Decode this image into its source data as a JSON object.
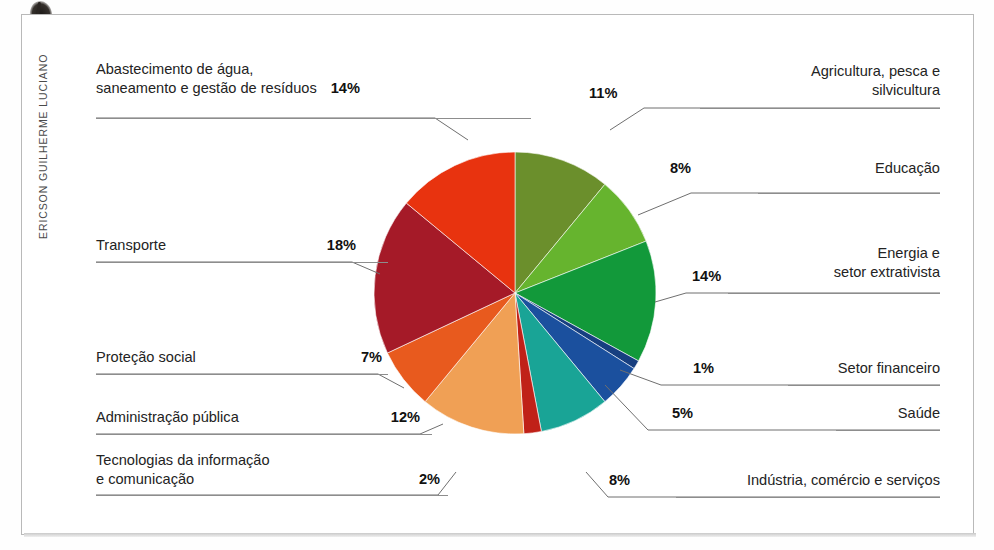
{
  "credit": "ERICSON GUILHERME LUCIANO",
  "chart_data": {
    "type": "pie",
    "title": "",
    "subtitle": "",
    "xlabel": "",
    "ylabel": "",
    "legend_position": "callout-labels",
    "grid": false,
    "unit": "%",
    "total": 100,
    "start_angle_deg": 0,
    "direction": "clockwise",
    "categories": [
      "Agricultura, pesca e silvicultura",
      "Educação",
      "Energia e setor extrativista",
      "Setor financeiro",
      "Saúde",
      "Indústria, comércio e serviços",
      "Tecnologias da informação e comunicação",
      "Administração pública",
      "Proteção social",
      "Transporte",
      "Abastecimento de água, saneamento e gestão de resíduos"
    ],
    "values": [
      11,
      8,
      14,
      1,
      5,
      8,
      2,
      12,
      7,
      18,
      14
    ],
    "colors": [
      "#6b8f2c",
      "#66b42e",
      "#12993a",
      "#173f80",
      "#1b509e",
      "#19a496",
      "#c02118",
      "#f0a055",
      "#e85a1e",
      "#a51a28",
      "#e8330f"
    ],
    "slices": [
      {
        "label": "Agricultura, pesca e silvicultura",
        "value": 11,
        "pct": "11%",
        "color": "#6b8f2c"
      },
      {
        "label": "Educação",
        "value": 8,
        "pct": "8%",
        "color": "#66b42e"
      },
      {
        "label": "Energia e setor extrativista",
        "value": 14,
        "pct": "14%",
        "color": "#12993a"
      },
      {
        "label": "Setor financeiro",
        "value": 1,
        "pct": "1%",
        "color": "#173f80"
      },
      {
        "label": "Saúde",
        "value": 5,
        "pct": "5%",
        "color": "#1b509e"
      },
      {
        "label": "Indústria, comércio e serviços",
        "value": 8,
        "pct": "8%",
        "color": "#19a496"
      },
      {
        "label": "Tecnologias da informação e comunicação",
        "value": 2,
        "pct": "2%",
        "color": "#c02118"
      },
      {
        "label": "Administração pública",
        "value": 12,
        "pct": "12%",
        "color": "#f0a055"
      },
      {
        "label": "Proteção social",
        "value": 7,
        "pct": "7%",
        "color": "#e85a1e"
      },
      {
        "label": "Transporte",
        "value": 18,
        "pct": "18%",
        "color": "#a51a28"
      },
      {
        "label": "Abastecimento de água, saneamento e gestão de resíduos",
        "value": 14,
        "pct": "14%",
        "color": "#e8330f"
      }
    ]
  },
  "labels": {
    "abastecimento": {
      "text": "Abastecimento de água,\nsaneamento e gestão de resíduos",
      "pct": "14%"
    },
    "transporte": {
      "text": "Transporte",
      "pct": "18%"
    },
    "protecao": {
      "text": "Proteção social",
      "pct": "7%"
    },
    "administracao": {
      "text": "Administração pública",
      "pct": "12%"
    },
    "tecnologias": {
      "text": "Tecnologias da informação\ne comunicação",
      "pct": "2%"
    },
    "agricultura": {
      "text": "Agricultura, pesca e\nsilvicultura",
      "pct": "11%"
    },
    "educacao": {
      "text": "Educação",
      "pct": "8%"
    },
    "energia": {
      "text": "Energia e\nsetor extrativista",
      "pct": "14%"
    },
    "financeiro": {
      "text": "Setor financeiro",
      "pct": "1%"
    },
    "saude": {
      "text": "Saúde",
      "pct": "5%"
    },
    "industria": {
      "text": "Indústria, comércio e serviços",
      "pct": "8%"
    }
  }
}
